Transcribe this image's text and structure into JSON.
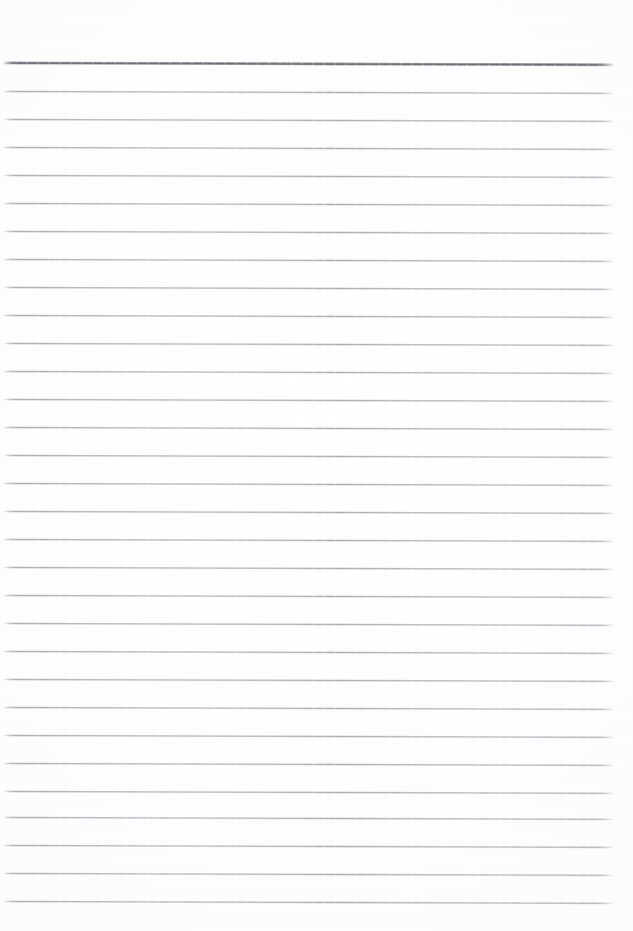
{
  "document": {
    "kind": "scanned-ruled-notebook-page",
    "title": "",
    "body_text": "",
    "page_width": 633,
    "page_height": 931,
    "background_color": "#fdfdfd"
  },
  "ruling": {
    "line_count": 31,
    "line_spacing_px": 28,
    "first_line_y": 63,
    "last_line_y": 901,
    "left_margin_px": 4,
    "right_edge_px": 613,
    "top_margin_px": 62,
    "bottom_margin_px": 30,
    "skew_degrees": 0.18,
    "header_rule": {
      "present": true,
      "index": 0,
      "color": "#6d737b",
      "thickness_px": 2
    },
    "body_rule": {
      "color": "#a8aeb6",
      "thickness_px": 1
    },
    "lines": [
      {
        "index": 0,
        "y": 63,
        "style": "header"
      },
      {
        "index": 1,
        "y": 91,
        "style": "body"
      },
      {
        "index": 2,
        "y": 119,
        "style": "body"
      },
      {
        "index": 3,
        "y": 147,
        "style": "body"
      },
      {
        "index": 4,
        "y": 175,
        "style": "body"
      },
      {
        "index": 5,
        "y": 203,
        "style": "body"
      },
      {
        "index": 6,
        "y": 231,
        "style": "body"
      },
      {
        "index": 7,
        "y": 259,
        "style": "body"
      },
      {
        "index": 8,
        "y": 287,
        "style": "body"
      },
      {
        "index": 9,
        "y": 315,
        "style": "body"
      },
      {
        "index": 10,
        "y": 343,
        "style": "body"
      },
      {
        "index": 11,
        "y": 371,
        "style": "body"
      },
      {
        "index": 12,
        "y": 399,
        "style": "body"
      },
      {
        "index": 13,
        "y": 427,
        "style": "body"
      },
      {
        "index": 14,
        "y": 455,
        "style": "body"
      },
      {
        "index": 15,
        "y": 483,
        "style": "body"
      },
      {
        "index": 16,
        "y": 511,
        "style": "body"
      },
      {
        "index": 17,
        "y": 539,
        "style": "body"
      },
      {
        "index": 18,
        "y": 567,
        "style": "body"
      },
      {
        "index": 19,
        "y": 595,
        "style": "body"
      },
      {
        "index": 20,
        "y": 623,
        "style": "body"
      },
      {
        "index": 21,
        "y": 651,
        "style": "body"
      },
      {
        "index": 22,
        "y": 679,
        "style": "body"
      },
      {
        "index": 23,
        "y": 707,
        "style": "body"
      },
      {
        "index": 24,
        "y": 735,
        "style": "body"
      },
      {
        "index": 25,
        "y": 763,
        "style": "body"
      },
      {
        "index": 26,
        "y": 791,
        "style": "body"
      },
      {
        "index": 27,
        "y": 817,
        "style": "body"
      },
      {
        "index": 28,
        "y": 845,
        "style": "body"
      },
      {
        "index": 29,
        "y": 873,
        "style": "body"
      },
      {
        "index": 30,
        "y": 901,
        "style": "body"
      }
    ]
  }
}
